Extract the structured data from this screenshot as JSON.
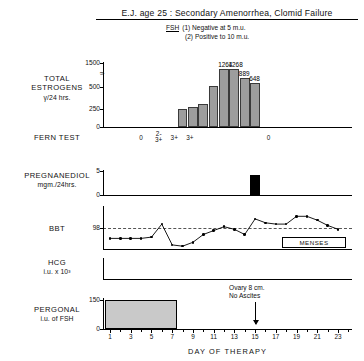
{
  "header": {
    "title": "E.J. age 25 : Secondary Amenorrhea, Clomid Failure",
    "fsh_label": "FSH",
    "fsh_note_1": "(1)  Negative at 5 m.u.",
    "fsh_note_2": "(2)  Positive to 10 m.u."
  },
  "panels": {
    "estrogen": {
      "label_line1": "TOTAL",
      "label_line2": "ESTROGENS",
      "label_line3": "γ/24 hrs.",
      "yticks": [
        "1500",
        "500",
        "250",
        "0"
      ],
      "break_symbol": "≈"
    },
    "fern": {
      "label": "FERN TEST"
    },
    "pregnanediol": {
      "label_line1": "PREGNANEDIOL",
      "label_line2": "mgm./24hrs.",
      "yticks": [
        "5",
        "0"
      ]
    },
    "bbt": {
      "label": "BBT",
      "ytick": "98"
    },
    "hcg": {
      "label_line1": "HCG",
      "label_line2": "i.u. x 10³"
    },
    "pergonal": {
      "label_line1": "PERGONAL",
      "label_line2": "i.u. of FSH",
      "yticks": [
        "150",
        "0"
      ]
    }
  },
  "annotations": {
    "menses": "MENSES",
    "ovary_line1": "Ovary 8 cm.",
    "ovary_line2": "No Ascites",
    "ovary_arrow_day": 15
  },
  "xaxis": {
    "title": "DAY OF THERAPY",
    "labels": [
      "1",
      "3",
      "5",
      "7",
      "9",
      "11",
      "13",
      "15",
      "17",
      "19",
      "21",
      "23"
    ],
    "label_days": [
      1,
      3,
      5,
      7,
      9,
      11,
      13,
      15,
      17,
      19,
      21,
      23
    ],
    "min_day": 1,
    "max_day": 24
  },
  "chart_data": {
    "type": "bar",
    "title": "E.J. age 25 : Secondary Amenorrhea, Clomid Failure",
    "xlabel": "DAY OF THERAPY",
    "panels": [
      {
        "name": "Total Estrogens",
        "type": "bar",
        "ylabel": "TOTAL ESTROGENS γ/24 hrs.",
        "ylim": [
          0,
          1500
        ],
        "ytick_values": [
          0,
          250,
          500,
          1500
        ],
        "axis_break_between": [
          500,
          1500
        ],
        "x": [
          8,
          9,
          10,
          11,
          12,
          13,
          14,
          15
        ],
        "values": [
          230,
          245,
          290,
          560,
          1264,
          1268,
          889,
          648
        ],
        "bar_labels": [
          "",
          "",
          "",
          "",
          "1264",
          "1268",
          "889",
          "648"
        ],
        "bar_color": "#9d9d9d"
      },
      {
        "name": "Fern Test",
        "type": "annotation-row",
        "marks": [
          {
            "day": 4,
            "text": "0"
          },
          {
            "day": 5.7,
            "text": "2-\n3+"
          },
          {
            "day": 7.2,
            "text": "3+"
          },
          {
            "day": 8.7,
            "text": "3+"
          },
          {
            "day": 16.3,
            "text": "0"
          }
        ]
      },
      {
        "name": "Pregnanediol",
        "type": "bar",
        "ylabel": "PREGNANEDIOL mgm./24hrs.",
        "ylim": [
          0,
          5
        ],
        "ytick_values": [
          0,
          5
        ],
        "x": [
          15
        ],
        "values": [
          4.2
        ],
        "bar_color": "#000000"
      },
      {
        "name": "BBT",
        "type": "line",
        "ylabel": "BBT",
        "reference_line": 98,
        "ytick_values": [
          98
        ],
        "x": [
          1,
          2,
          3,
          4,
          5,
          6,
          7,
          8,
          9,
          10,
          11,
          12,
          13,
          14,
          15,
          16,
          17,
          18,
          19,
          20,
          21,
          22,
          23
        ],
        "values": [
          97.6,
          97.6,
          97.6,
          97.6,
          97.65,
          98.15,
          97.35,
          97.3,
          97.45,
          97.75,
          97.9,
          98.05,
          97.95,
          97.75,
          98.35,
          98.2,
          98.15,
          98.15,
          98.45,
          98.45,
          98.3,
          98.1,
          97.95
        ]
      },
      {
        "name": "HCG",
        "type": "bar",
        "ylabel": "HCG i.u. x 10³",
        "x": [],
        "values": []
      },
      {
        "name": "Pergonal",
        "type": "bar",
        "ylabel": "PERGONAL i.u. of FSH",
        "ylim": [
          0,
          150
        ],
        "ytick_values": [
          0,
          150
        ],
        "x": [
          1,
          2,
          3,
          4,
          5,
          6,
          7
        ],
        "values": [
          150,
          150,
          150,
          150,
          150,
          150,
          150
        ],
        "bar_color": "#c9c9c9",
        "note": "continuous block days 1-7"
      }
    ]
  }
}
